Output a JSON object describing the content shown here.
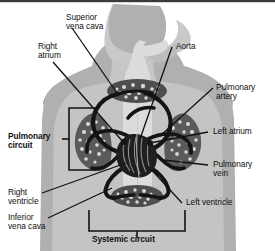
{
  "figure": {
    "type": "anatomical-diagram",
    "width": 275,
    "height": 251,
    "background_color": "#ffffff",
    "ink_color": "#101010",
    "body_fill": "#b4b4b4",
    "body_inner_fill": "#cfcfcf",
    "airway_fill": "#dcdcdc",
    "organ_fill": "#5a5a5a",
    "vessel_color": "#141414"
  },
  "labels": {
    "superior_vena_cava": "Superior\nvena cava",
    "right_atrium": "Right\natrium",
    "aorta": "Aorta",
    "pulmonary_artery": "Pulmonary\nartery",
    "left_atrium": "Left atrium",
    "pulmonary_vein": "Pulmonary\nvein",
    "pulmonary_circuit": "Pulmonary\ncircuit",
    "right_ventricle": "Right\nventricle",
    "inferior_vena_cava": "Inferior\nvena cava",
    "left_ventricle": "Left ventricle",
    "systemic_circuit": "Systemic circuit"
  },
  "structures": [
    {
      "name": "superior-vena-cava",
      "label": "Superior vena cava",
      "side": "left",
      "emphasis": "normal"
    },
    {
      "name": "right-atrium",
      "label": "Right atrium",
      "side": "left",
      "emphasis": "normal"
    },
    {
      "name": "aorta",
      "label": "Aorta",
      "side": "right",
      "emphasis": "normal"
    },
    {
      "name": "pulmonary-artery",
      "label": "Pulmonary artery",
      "side": "right",
      "emphasis": "normal"
    },
    {
      "name": "left-atrium",
      "label": "Left atrium",
      "side": "right",
      "emphasis": "normal"
    },
    {
      "name": "pulmonary-vein",
      "label": "Pulmonary vein",
      "side": "right",
      "emphasis": "normal"
    },
    {
      "name": "pulmonary-circuit",
      "label": "Pulmonary circuit",
      "side": "left",
      "emphasis": "bold"
    },
    {
      "name": "right-ventricle",
      "label": "Right ventricle",
      "side": "left",
      "emphasis": "normal"
    },
    {
      "name": "inferior-vena-cava",
      "label": "Inferior vena cava",
      "side": "left",
      "emphasis": "normal"
    },
    {
      "name": "left-ventricle",
      "label": "Left ventricle",
      "side": "right",
      "emphasis": "normal"
    },
    {
      "name": "systemic-circuit",
      "label": "Systemic circuit",
      "side": "bottom",
      "emphasis": "bold"
    }
  ]
}
